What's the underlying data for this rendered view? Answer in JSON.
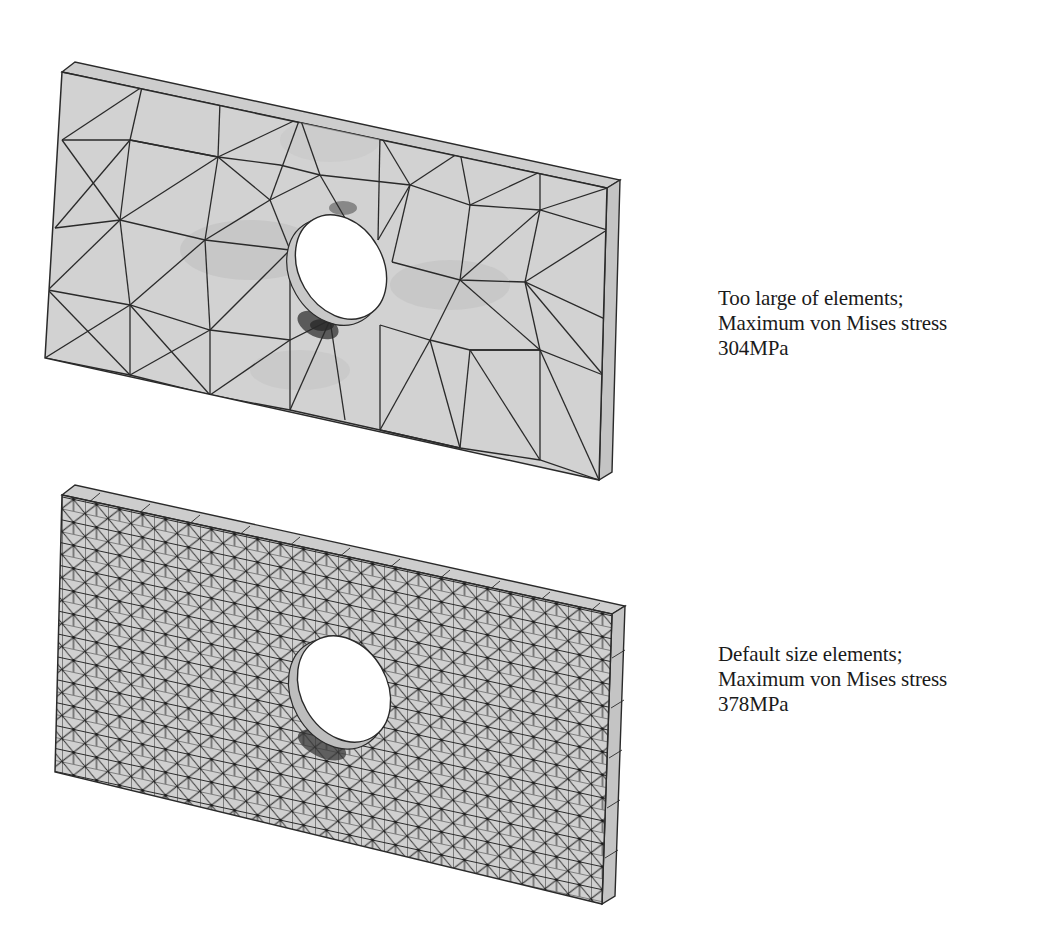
{
  "figure": {
    "panels": [
      {
        "id": "coarse-mesh",
        "mesh_description": "Plate with central hole, large tetrahedral elements",
        "caption": {
          "line1": "Too large of elements;",
          "line2": "Maximum von Mises stress",
          "line3": "304MPa"
        },
        "max_von_mises_stress": "304MPa"
      },
      {
        "id": "default-mesh",
        "mesh_description": "Plate with central hole, default size tetrahedral elements",
        "caption": {
          "line1": "Default size elements;",
          "line2": "Maximum von Mises stress",
          "line3": "378MPa"
        },
        "max_von_mises_stress": "378MPa"
      }
    ],
    "colors": {
      "plate_fill": "#d2d2d2",
      "plate_side": "#c4c4c4",
      "mesh_line": "#2a2a2a",
      "stress_dark": "#555555",
      "hole": "#ffffff",
      "caption_text": "#1a1a1a"
    }
  }
}
